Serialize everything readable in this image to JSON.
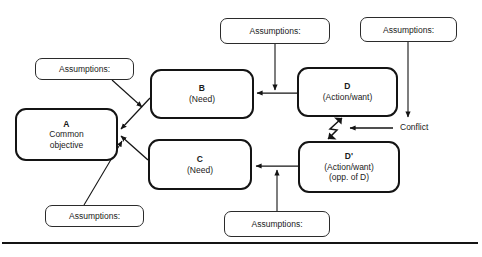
{
  "diagram": {
    "stroke_color": "#141414",
    "background": "#ffffff",
    "entities": [
      {
        "id": "A",
        "label": "A",
        "line2": "Common",
        "line3": "objective",
        "x": 15,
        "y": 108,
        "w": 103,
        "h": 53,
        "heavy": true
      },
      {
        "id": "B",
        "label": "B",
        "line2": "(Need)",
        "line3": "",
        "x": 150,
        "y": 69,
        "w": 104,
        "h": 50,
        "heavy": true
      },
      {
        "id": "C",
        "label": "C",
        "line2": "(Need)",
        "line3": "",
        "x": 148,
        "y": 139,
        "w": 104,
        "h": 51,
        "heavy": true
      },
      {
        "id": "D",
        "label": "D",
        "line2": "(Action/want)",
        "line3": "",
        "x": 297,
        "y": 67,
        "w": 101,
        "h": 50,
        "heavy": true
      },
      {
        "id": "Dp",
        "label": "D'",
        "line2": "(Action/want)",
        "line3": "(opp. of D)",
        "x": 298,
        "y": 141,
        "w": 102,
        "h": 52,
        "heavy": true
      }
    ],
    "assumptions": [
      {
        "id": "a-left-top",
        "label": "Assumptions:",
        "x": 35,
        "y": 58,
        "w": 99,
        "h": 22
      },
      {
        "id": "a-left-bottom",
        "label": "Assumptions:",
        "x": 45,
        "y": 205,
        "w": 99,
        "h": 22
      },
      {
        "id": "a-top-mid",
        "label": "Assumptions:",
        "x": 220,
        "y": 18,
        "w": 110,
        "h": 26
      },
      {
        "id": "a-top-right",
        "label": "Assumptions:",
        "x": 360,
        "y": 17,
        "w": 97,
        "h": 25
      },
      {
        "id": "a-bottom-mid",
        "label": "Assumptions:",
        "x": 224,
        "y": 211,
        "w": 106,
        "h": 26
      }
    ],
    "annotations": [
      {
        "id": "conflict",
        "label": "Conflict",
        "x": 399,
        "y": 122
      }
    ],
    "baseline_rule": {
      "y": 243,
      "x1": 2,
      "x2": 478
    }
  }
}
